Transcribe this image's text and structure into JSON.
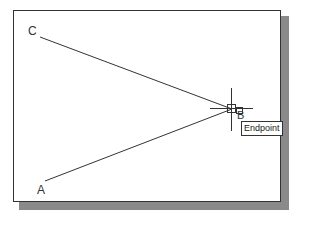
{
  "drawing": {
    "points": {
      "A": {
        "label": "A",
        "x": 45,
        "y": 181
      },
      "B": {
        "label": "B",
        "x": 232,
        "y": 109
      },
      "C": {
        "label": "C",
        "x": 40,
        "y": 37
      }
    },
    "lines": [
      {
        "from": "C",
        "to": "B"
      },
      {
        "from": "A",
        "to": "B"
      }
    ],
    "cursor": {
      "type": "crosshair",
      "x": 232,
      "y": 109
    },
    "snap": {
      "marker": "endpoint-square",
      "tooltip": "Endpoint"
    }
  },
  "colors": {
    "line": "#333333",
    "shadow": "#8a8a8a",
    "background": "#ffffff"
  }
}
